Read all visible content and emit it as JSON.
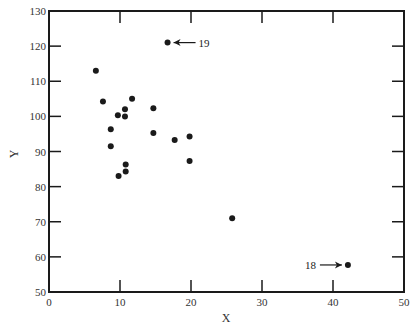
{
  "chart_data": {
    "type": "scatter",
    "title": "",
    "xlabel": "X",
    "ylabel": "Y",
    "xlim": [
      0,
      50
    ],
    "ylim": [
      50,
      130
    ],
    "xticks": [
      0,
      10,
      20,
      30,
      40,
      50
    ],
    "yticks": [
      50,
      60,
      70,
      80,
      90,
      100,
      110,
      120,
      130
    ],
    "grid": false,
    "legend": "none",
    "series": [
      {
        "name": "observations",
        "color": "#1a1a1a",
        "points": [
          {
            "x": 6.6,
            "y": 113.0
          },
          {
            "x": 7.6,
            "y": 104.2
          },
          {
            "x": 11.7,
            "y": 105.0
          },
          {
            "x": 10.7,
            "y": 102.0
          },
          {
            "x": 9.7,
            "y": 100.3
          },
          {
            "x": 10.7,
            "y": 100.0
          },
          {
            "x": 14.7,
            "y": 102.3
          },
          {
            "x": 8.7,
            "y": 96.3
          },
          {
            "x": 14.7,
            "y": 95.3
          },
          {
            "x": 8.7,
            "y": 91.5
          },
          {
            "x": 17.7,
            "y": 93.3
          },
          {
            "x": 19.8,
            "y": 94.3
          },
          {
            "x": 19.8,
            "y": 87.3
          },
          {
            "x": 10.8,
            "y": 86.3
          },
          {
            "x": 10.8,
            "y": 84.3
          },
          {
            "x": 9.8,
            "y": 83.0
          },
          {
            "x": 25.8,
            "y": 71.0
          },
          {
            "x": 42.1,
            "y": 57.7
          },
          {
            "x": 16.7,
            "y": 121.0
          }
        ]
      }
    ],
    "annotations": [
      {
        "text": "18",
        "x": 42.1,
        "y": 57.7,
        "side": "left"
      },
      {
        "text": "19",
        "x": 16.7,
        "y": 121.0,
        "side": "right"
      }
    ]
  }
}
